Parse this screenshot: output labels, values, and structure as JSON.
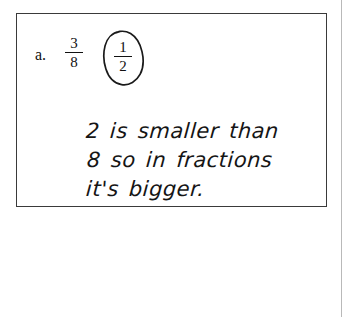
{
  "page": {
    "background_color": "#ffffff",
    "scan_artifact": "faint-vertical-line"
  },
  "answer_box": {
    "border_color": "#3a3a3a",
    "problem": {
      "item_letter": "a.",
      "choices": [
        {
          "name": "fraction-three-eighths",
          "numerator": "3",
          "denominator": "8",
          "circled": false
        },
        {
          "name": "fraction-one-half",
          "numerator": "1",
          "denominator": "2",
          "circled": true
        }
      ],
      "circle_annotation": "hand-drawn-oval-around-one-half"
    },
    "student_response": {
      "ink_color": "#151515",
      "lines": [
        "2 is smaller than",
        "8 so in fractions",
        "it's bigger."
      ],
      "full_text": "2 is smaller than 8 so in fractions it's bigger."
    }
  }
}
